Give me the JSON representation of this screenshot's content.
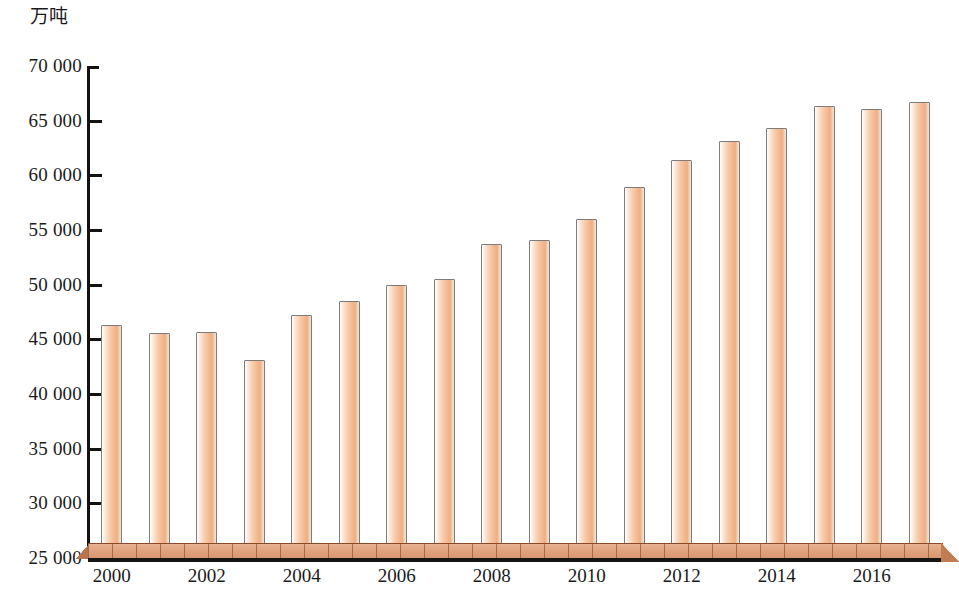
{
  "chart_data": {
    "type": "bar",
    "title": "",
    "unit_label": "万吨",
    "xlabel": "",
    "ylabel": "",
    "ylim": [
      25000,
      70000
    ],
    "ytick_step": 5000,
    "grid": false,
    "legend": null,
    "bar_style": "3d-cylinder",
    "categories": [
      "2000",
      "2001",
      "2002",
      "2003",
      "2004",
      "2005",
      "2006",
      "2007",
      "2008",
      "2009",
      "2010",
      "2011",
      "2012",
      "2013",
      "2014",
      "2015",
      "2016",
      "2017"
    ],
    "xtick_labels": [
      "2000",
      "2002",
      "2004",
      "2006",
      "2008",
      "2010",
      "2012",
      "2014",
      "2016"
    ],
    "ytick_labels": [
      "70 000",
      "65 000",
      "60 000",
      "55 000",
      "50 000",
      "45 000",
      "40 000",
      "35 000",
      "30 000",
      "25 000"
    ],
    "ytick_values": [
      70000,
      65000,
      60000,
      55000,
      50000,
      45000,
      40000,
      35000,
      30000,
      25000
    ],
    "values": [
      46300,
      45600,
      45700,
      43100,
      47200,
      48500,
      50000,
      50500,
      53700,
      54100,
      56000,
      58900,
      61400,
      63100,
      64300,
      66300,
      66100,
      66700
    ],
    "colors": {
      "bar_fill_light": "#fdf0e6",
      "bar_fill_mid": "#f4bb93",
      "bar_fill_dark": "#eeac7f",
      "bar_outline": "#7c7c7c",
      "floor_top": "#dfa07c",
      "floor_edge": "#8a4a28",
      "axis": "#121212",
      "text": "#1a1a1a",
      "background": "#ffffff"
    }
  }
}
